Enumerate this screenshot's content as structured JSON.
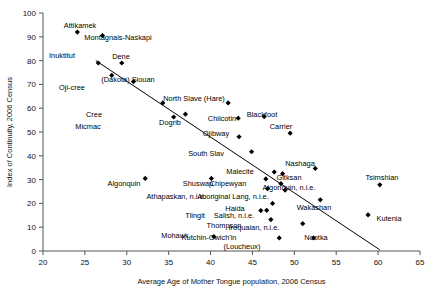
{
  "chart_data": {
    "type": "scatter",
    "title": "",
    "xlabel": "Average Age of Mother Tongue population, 2006 Census",
    "ylabel": "Index of Continuity, 2006 Census",
    "xlim": [
      20,
      65
    ],
    "ylim": [
      0,
      100
    ],
    "xticks": [
      20,
      25,
      30,
      35,
      40,
      45,
      50,
      55,
      60,
      65
    ],
    "yticks": [
      0,
      10,
      20,
      30,
      40,
      50,
      60,
      70,
      80,
      90,
      100
    ],
    "grid": false,
    "legend": "none",
    "marker_style": "filled-diamond",
    "trendline": {
      "present": true,
      "x0": 26.3,
      "y0": 80.0,
      "x1": 60.2,
      "y1": 0.5
    },
    "points": [
      {
        "label": "Attikamek",
        "x": 24.1,
        "y": 92.0,
        "lx": 80,
        "ly": 28
      },
      {
        "label": "Montagnais-Naskapi",
        "x": 27.1,
        "y": 90.5,
        "lx": 118,
        "ly": 40
      },
      {
        "label": "Inuktitut",
        "x": 26.6,
        "y": 79.0,
        "lx": 62,
        "ly": 58
      },
      {
        "label": "Dene",
        "x": 29.4,
        "y": 79.0,
        "lx": 121,
        "ly": 59
      },
      {
        "label": "Oji-cree",
        "x": 28.2,
        "y": 73.8,
        "lx": 72,
        "ly": 90
      },
      {
        "label": "(Dakota) Siouan",
        "x": 30.8,
        "y": 71.2,
        "lx": 128,
        "ly": 82
      },
      {
        "label": "North Slave (Hare)",
        "x": 42.1,
        "y": 62.2,
        "lx": 194,
        "ly": 101
      },
      {
        "label": "Cree",
        "x": 34.3,
        "y": 62.2,
        "lx": 94,
        "ly": 117
      },
      {
        "label": "Dogrib",
        "x": 37.0,
        "y": 57.5,
        "lx": 170,
        "ly": 125
      },
      {
        "label": "Chilcotin",
        "x": 43.3,
        "y": 55.8,
        "lx": 222,
        "ly": 121
      },
      {
        "label": "Blackfoot",
        "x": 46.4,
        "y": 56.5,
        "lx": 262,
        "ly": 117
      },
      {
        "label": "Micmac",
        "x": 35.6,
        "y": 56.3,
        "lx": 88,
        "ly": 129
      },
      {
        "label": "Carrier",
        "x": 49.5,
        "y": 49.5,
        "lx": 281,
        "ly": 129
      },
      {
        "label": "Ojibway",
        "x": 43.4,
        "y": 48.0,
        "lx": 216,
        "ly": 136
      },
      {
        "label": "South Slav",
        "x": 44.9,
        "y": 41.7,
        "lx": 206,
        "ly": 156
      },
      {
        "label": "Nashaga",
        "x": 52.5,
        "y": 34.7,
        "lx": 300,
        "ly": 166
      },
      {
        "label": "Malecite",
        "x": 47.6,
        "y": 33.2,
        "lx": 240,
        "ly": 174
      },
      {
        "label": "Gitksan",
        "x": 48.6,
        "y": 32.5,
        "lx": 289,
        "ly": 180
      },
      {
        "label": "Algonquin",
        "x": 32.2,
        "y": 30.5,
        "lx": 124,
        "ly": 186
      },
      {
        "label": "Shuswap",
        "x": 40.1,
        "y": 30.5,
        "lx": 198,
        "ly": 186
      },
      {
        "label": "Chipewyan",
        "x": 46.6,
        "y": 30.3,
        "lx": 228,
        "ly": 186
      },
      {
        "label": "Tsimshian",
        "x": 60.2,
        "y": 27.8,
        "lx": 382,
        "ly": 180
      },
      {
        "label": "Algonquin, n.i.e.",
        "x": 48.4,
        "y": 28.3,
        "lx": 289,
        "ly": 190
      },
      {
        "label": "Athapaskan, n.i.e.",
        "x": 46.8,
        "y": 26.2,
        "lx": 176,
        "ly": 199
      },
      {
        "label": "Aboriginal Lang, n.i.e.",
        "x": 48.9,
        "y": 25.6,
        "lx": 233,
        "ly": 199
      },
      {
        "label": "Wakashan",
        "x": 53.1,
        "y": 21.5,
        "lx": 314,
        "ly": 210
      },
      {
        "label": "Haida",
        "x": 47.4,
        "y": 20.0,
        "lx": 235,
        "ly": 211
      },
      {
        "label": "Tlingit",
        "x": 46.0,
        "y": 17.0,
        "lx": 195,
        "ly": 218
      },
      {
        "label": "Salish, n.i.e.",
        "x": 46.7,
        "y": 17.1,
        "lx": 234,
        "ly": 218
      },
      {
        "label": "Kutenia",
        "x": 58.8,
        "y": 15.2,
        "lx": 389,
        "ly": 221
      },
      {
        "label": "Thompson",
        "x": 47.2,
        "y": 13.2,
        "lx": 224,
        "ly": 228
      },
      {
        "label": "Iroquaian, n.i.e.",
        "x": 51.0,
        "y": 11.5,
        "lx": 254,
        "ly": 230
      },
      {
        "label": "Mohawk",
        "x": 40.4,
        "y": 6.0,
        "lx": 175,
        "ly": 238
      },
      {
        "label": "Nootka",
        "x": 52.3,
        "y": 5.5,
        "lx": 316,
        "ly": 240
      },
      {
        "label": "Kutchin-Gwich'in",
        "x": 48.2,
        "y": 5.5,
        "lx": 209,
        "ly": 240
      },
      {
        "label": "(Loucheux)",
        "x": null,
        "y": null,
        "lx": 242,
        "ly": 249
      }
    ]
  }
}
